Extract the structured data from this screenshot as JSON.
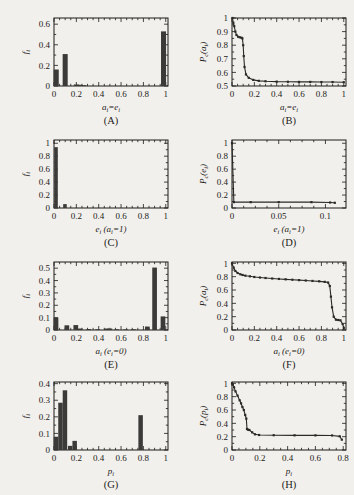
{
  "figure": {
    "background": "#f2f0ec",
    "ink": "#1c1b19",
    "bar_color": "#3b3a38",
    "layout": "2 columns x 4 rows of small plots"
  },
  "panels": [
    {
      "id": "A",
      "label": "(A)",
      "xlabel": "a",
      "xlabel_sub": "i",
      "xlabel_tail": "=e",
      "xlabel_tail_sub": "i",
      "ylabel": "f",
      "ylabel_sub": "i",
      "xticks": [
        "0",
        "0.2",
        "0.4",
        "0.6",
        "0.8",
        "1"
      ],
      "yticks": [
        "0",
        "0.2",
        "0.4",
        "0.6"
      ]
    },
    {
      "id": "B",
      "label": "(B)",
      "xlabel": "a",
      "xlabel_sub": "i",
      "xlabel_tail": "=e",
      "xlabel_tail_sub": "i",
      "ylabel": "P",
      "ylabel_sub": "c",
      "ylabel_tail": "(a",
      "ylabel_tail_sub": "i",
      "ylabel_close": ")",
      "xticks": [
        "0",
        "0.2",
        "0.4",
        "0.6",
        "0.8",
        "1"
      ],
      "yticks": [
        "0.5",
        "0.6",
        "0.7",
        "0.8",
        "0.9",
        "1"
      ]
    },
    {
      "id": "C",
      "label": "(C)",
      "xlabel": "e",
      "xlabel_sub": "i",
      "xlabel_tail": " (a",
      "xlabel_tail_sub": "i",
      "xlabel_close": "=1)",
      "ylabel": "f",
      "ylabel_sub": "i",
      "xticks": [
        "0",
        "0.2",
        "0.4",
        "0.6",
        "0.8",
        "1"
      ],
      "yticks": [
        "0",
        "0.2",
        "0.4",
        "0.6",
        "0.8",
        "1"
      ]
    },
    {
      "id": "D",
      "label": "(D)",
      "xlabel": "e",
      "xlabel_sub": "i",
      "xlabel_tail": " (a",
      "xlabel_tail_sub": "i",
      "xlabel_close": "=1)",
      "ylabel": "P",
      "ylabel_sub": "c",
      "ylabel_tail": "(e",
      "ylabel_tail_sub": "i",
      "ylabel_close": ")",
      "xticks": [
        "0",
        "0.05",
        "0.1"
      ],
      "yticks": [
        "0",
        "0.2",
        "0.4",
        "0.6",
        "0.8",
        "1"
      ]
    },
    {
      "id": "E",
      "label": "(E)",
      "xlabel": "a",
      "xlabel_sub": "i",
      "xlabel_tail": " (e",
      "xlabel_tail_sub": "i",
      "xlabel_close": "=0)",
      "ylabel": "f",
      "ylabel_sub": "i",
      "xticks": [
        "0",
        "0.2",
        "0.4",
        "0.6",
        "0.8",
        "1"
      ],
      "yticks": [
        "0",
        "0.1",
        "0.2",
        "0.3",
        "0.4",
        "0.5"
      ]
    },
    {
      "id": "F",
      "label": "(F)",
      "xlabel": "a",
      "xlabel_sub": "i",
      "xlabel_tail": " (e",
      "xlabel_tail_sub": "i",
      "xlabel_close": "=0)",
      "ylabel": "P",
      "ylabel_sub": "c",
      "ylabel_tail": "(a",
      "ylabel_tail_sub": "i",
      "ylabel_close": ")",
      "xticks": [
        "0",
        "0.2",
        "0.4",
        "0.6",
        "0.8",
        "1"
      ],
      "yticks": [
        "0",
        "0.2",
        "0.4",
        "0.6",
        "0.8",
        "1"
      ]
    },
    {
      "id": "G",
      "label": "(G)",
      "xlabel": "p",
      "xlabel_sub": "i",
      "ylabel": "f",
      "ylabel_sub": "i",
      "xticks": [
        "0",
        "0.2",
        "0.4",
        "0.6",
        "0.8",
        "1"
      ],
      "yticks": [
        "0",
        "0.1",
        "0.2",
        "0.3",
        "0.4"
      ]
    },
    {
      "id": "H",
      "label": "(H)",
      "xlabel": "p",
      "xlabel_sub": "i",
      "ylabel": "P",
      "ylabel_sub": "c",
      "ylabel_tail": "(p",
      "ylabel_tail_sub": "i",
      "ylabel_close": ")",
      "xticks": [
        "0",
        "0.2",
        "0.4",
        "0.6",
        "0.8"
      ],
      "yticks": [
        "0",
        "0.2",
        "0.4",
        "0.6",
        "0.8",
        "1"
      ]
    }
  ],
  "chart_data": [
    {
      "type": "bar",
      "panel": "A",
      "title": "",
      "xlabel": "a_i=e_i",
      "ylabel": "f_i",
      "xlim": [
        0,
        1.02
      ],
      "ylim": [
        0,
        0.66
      ],
      "bin_width": 0.045,
      "x": [
        0.02,
        0.1,
        0.2,
        0.235,
        0.265,
        0.98
      ],
      "values": [
        0.16,
        0.31,
        0.015,
        0.012,
        0.008,
        0.53
      ],
      "grid": false
    },
    {
      "type": "line",
      "panel": "B",
      "title": "",
      "xlabel": "a_i=e_i",
      "ylabel": "P_c(a_i)",
      "xlim": [
        0,
        1.02
      ],
      "ylim": [
        0.5,
        1.0
      ],
      "markers": true,
      "x": [
        0.004,
        0.012,
        0.02,
        0.03,
        0.04,
        0.055,
        0.07,
        0.085,
        0.093,
        0.1,
        0.105,
        0.112,
        0.125,
        0.15,
        0.19,
        0.24,
        0.3,
        0.4,
        0.5,
        0.6,
        0.7,
        0.8,
        0.9,
        1.0
      ],
      "y": [
        1.0,
        0.965,
        0.94,
        0.9,
        0.875,
        0.862,
        0.858,
        0.855,
        0.85,
        0.8,
        0.72,
        0.64,
        0.585,
        0.56,
        0.545,
        0.538,
        0.535,
        0.532,
        0.531,
        0.53,
        0.53,
        0.529,
        0.529,
        0.528
      ],
      "grid": false
    },
    {
      "type": "bar",
      "panel": "C",
      "title": "",
      "xlabel": "e_i (a_i=1)",
      "ylabel": "f_i",
      "xlim": [
        0,
        1.02
      ],
      "ylim": [
        0,
        1.05
      ],
      "bin_width": 0.032,
      "x": [
        0.018,
        0.098
      ],
      "values": [
        0.94,
        0.06
      ],
      "grid": false
    },
    {
      "type": "line",
      "panel": "D",
      "title": "",
      "xlabel": "e_i (a_i=1)",
      "ylabel": "P_c(e_i)",
      "xlim": [
        0,
        0.122
      ],
      "ylim": [
        0,
        1.05
      ],
      "markers": true,
      "x": [
        0.0,
        0.002,
        0.02,
        0.05,
        0.085,
        0.105,
        0.11
      ],
      "y": [
        1.0,
        0.09,
        0.09,
        0.09,
        0.09,
        0.085,
        0.08
      ],
      "grid": false
    },
    {
      "type": "bar",
      "panel": "E",
      "title": "",
      "xlabel": "a_i (e_i=0)",
      "ylabel": "f_i",
      "xlim": [
        0,
        1.02
      ],
      "ylim": [
        0,
        0.55
      ],
      "bin_width": 0.042,
      "x": [
        0.018,
        0.115,
        0.195,
        0.235,
        0.31,
        0.39,
        0.47,
        0.5,
        0.56,
        0.64,
        0.71,
        0.835,
        0.9,
        0.975
      ],
      "values": [
        0.1,
        0.038,
        0.04,
        0.012,
        0.008,
        0.006,
        0.012,
        0.012,
        0.006,
        0.005,
        0.006,
        0.028,
        0.505,
        0.11
      ],
      "grid": false
    },
    {
      "type": "line",
      "panel": "F",
      "title": "",
      "xlabel": "a_i (e_i=0)",
      "ylabel": "P_c(a_i)",
      "xlim": [
        0,
        1.02
      ],
      "ylim": [
        0,
        1.02
      ],
      "markers": true,
      "x": [
        0.0,
        0.015,
        0.03,
        0.05,
        0.075,
        0.095,
        0.12,
        0.16,
        0.2,
        0.25,
        0.3,
        0.36,
        0.42,
        0.48,
        0.54,
        0.6,
        0.66,
        0.72,
        0.78,
        0.83,
        0.86,
        0.875,
        0.885,
        0.895,
        0.91,
        0.93,
        0.95,
        0.97,
        0.99,
        1.0
      ],
      "y": [
        1.0,
        0.935,
        0.885,
        0.855,
        0.835,
        0.825,
        0.815,
        0.805,
        0.795,
        0.787,
        0.78,
        0.772,
        0.766,
        0.76,
        0.754,
        0.748,
        0.742,
        0.736,
        0.73,
        0.722,
        0.712,
        0.66,
        0.5,
        0.34,
        0.2,
        0.155,
        0.15,
        0.145,
        0.09,
        0.03
      ],
      "grid": false
    },
    {
      "type": "bar",
      "panel": "G",
      "title": "",
      "xlabel": "p_i",
      "ylabel": "f_i",
      "xlim": [
        0,
        1.02
      ],
      "ylim": [
        0,
        0.41
      ],
      "bin_width": 0.04,
      "x": [
        0.018,
        0.058,
        0.098,
        0.145,
        0.185,
        0.775
      ],
      "values": [
        0.08,
        0.285,
        0.36,
        0.025,
        0.055,
        0.21
      ],
      "grid": false
    },
    {
      "type": "line",
      "panel": "H",
      "title": "",
      "xlabel": "p_i",
      "ylabel": "P_c(p_i)",
      "xlim": [
        0,
        0.82
      ],
      "ylim": [
        0,
        1.02
      ],
      "markers": true,
      "x": [
        0.0,
        0.006,
        0.015,
        0.025,
        0.04,
        0.055,
        0.065,
        0.075,
        0.085,
        0.095,
        0.103,
        0.108,
        0.115,
        0.125,
        0.145,
        0.165,
        0.195,
        0.3,
        0.45,
        0.6,
        0.72,
        0.775,
        0.79
      ],
      "y": [
        1.0,
        0.985,
        0.94,
        0.88,
        0.815,
        0.745,
        0.7,
        0.645,
        0.6,
        0.525,
        0.47,
        0.315,
        0.305,
        0.3,
        0.265,
        0.235,
        0.225,
        0.222,
        0.22,
        0.219,
        0.218,
        0.205,
        0.155
      ],
      "grid": false
    }
  ]
}
